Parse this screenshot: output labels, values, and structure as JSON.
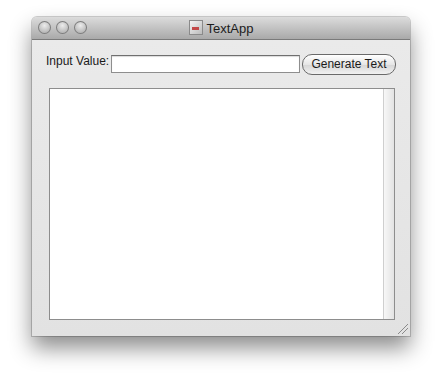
{
  "window": {
    "title": "TextApp",
    "title_icon": "app-document-icon",
    "traffic_lights": [
      "close",
      "minimize",
      "zoom"
    ]
  },
  "form": {
    "input_label": "Input Value:",
    "input_value": "",
    "input_placeholder": "",
    "generate_button_label": "Generate Text"
  },
  "output": {
    "text": ""
  }
}
